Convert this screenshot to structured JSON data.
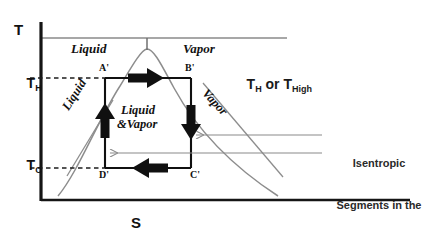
{
  "figure": {
    "axes": {
      "y_label": "T",
      "x_label": "S",
      "ticks": [
        {
          "id": "t-high",
          "base": "T",
          "sub": "H"
        },
        {
          "id": "t-cold",
          "base": "T",
          "sub": "C"
        }
      ]
    },
    "regions": {
      "liquid_top": "Liquid",
      "vapor_top": "Vapor",
      "liquid_side": "Liquid",
      "vapor_side": "Vapor",
      "two_phase_line1": "Liquid",
      "two_phase_line2": "&Vapor"
    },
    "state_points": [
      {
        "id": "a-prime",
        "label": "A'"
      },
      {
        "id": "b-prime",
        "label": "B'"
      },
      {
        "id": "c-prime",
        "label": "C'"
      },
      {
        "id": "d-prime",
        "label": "D'"
      }
    ],
    "annotations": {
      "t_high_text": {
        "prefix": "T",
        "sub1": "H",
        "middle": " or T",
        "sub2": "High"
      },
      "callout_line1": "Isentropic",
      "callout_line2": "Segments in the",
      "callout_line3": "Carnot Cycle"
    },
    "colors": {
      "ink": "#111111",
      "dome": "#777777",
      "rule": "#808080",
      "pointer": "#8a8a8a",
      "background": "#ffffff"
    }
  }
}
